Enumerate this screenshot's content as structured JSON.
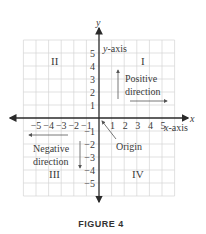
{
  "figure": {
    "caption": "FIGURE 4",
    "x_axis_label": "x",
    "y_axis_label": "y",
    "x_axis_name": "x-axis",
    "y_axis_name": "y-axis",
    "origin_label": "Origin",
    "quadrants": {
      "I": "I",
      "II": "II",
      "III": "III",
      "IV": "IV"
    },
    "positive_direction": [
      "Positive",
      "direction"
    ],
    "negative_direction": [
      "Negative",
      "direction"
    ],
    "x_ticks_negative": [
      "−5",
      "−4",
      "−3",
      "−2",
      "−1"
    ],
    "x_ticks_positive": [
      "1",
      "2",
      "3",
      "4",
      "5"
    ],
    "y_ticks_positive": [
      "1",
      "2",
      "3",
      "4",
      "5"
    ],
    "y_ticks_negative": [
      "−1",
      "−2",
      "−3",
      "−4",
      "−5"
    ],
    "grid_range": [
      -6,
      6
    ],
    "colors": {
      "axis": "#2a2a2a",
      "grid": "#d4d4d4",
      "text": "#3a3a3a"
    }
  }
}
